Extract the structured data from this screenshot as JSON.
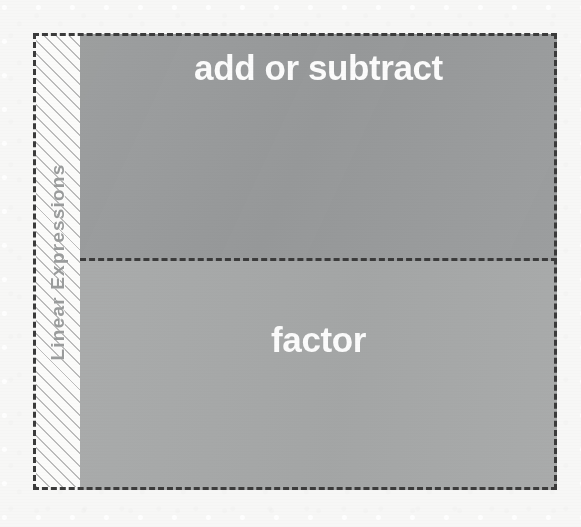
{
  "diagram": {
    "type": "stacked-block-diagram",
    "title": "",
    "axis": {
      "label": "Linear Expressions",
      "orientation": "vertical-rotated-ccw",
      "fill": "diagonal-hatch",
      "label_color": "#9a9c9c"
    },
    "frame": {
      "border_style": "dashed",
      "border_color": "#3b3b3b"
    },
    "blocks": [
      {
        "label": "add or subtract",
        "fill_color": "#999b9c",
        "text_color": "#fbfbfb",
        "position": "top"
      },
      {
        "label": "factor",
        "fill_color": "#a6a8a8",
        "text_color": "#fbfbfb",
        "position": "bottom"
      }
    ],
    "background_color": "#f7f7f6"
  },
  "chart_data": {
    "type": "bar",
    "title": "",
    "xlabel": "",
    "ylabel": "Linear Expressions",
    "categories": [
      "add or subtract",
      "factor"
    ],
    "values": [
      1,
      1
    ],
    "orientation": "stacked-vertical",
    "grid": false,
    "legend": "none"
  }
}
